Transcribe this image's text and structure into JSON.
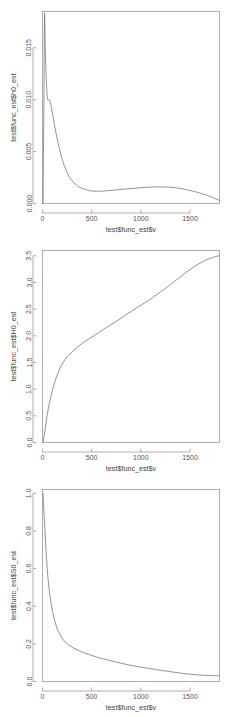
{
  "figure": {
    "background": "#ffffff",
    "line_color": "#6e6e6e",
    "axis_color": "#8c8c8c",
    "text_color": "#555555",
    "layout": "3 stacked panels, 1 column"
  },
  "chart_data": [
    {
      "type": "line",
      "title": "",
      "xlabel": "test$func_est$v",
      "ylabel": "test$func_est$h0_est",
      "xlim": [
        0,
        1800
      ],
      "ylim": [
        0,
        0.0185
      ],
      "xticks": [
        0,
        500,
        1000,
        1500
      ],
      "xtick_labels": [
        "0",
        "500",
        "1000",
        "1500"
      ],
      "yticks": [
        0.0,
        0.005,
        0.01,
        0.015
      ],
      "ytick_labels": [
        "0.000",
        "0.005",
        "0.010",
        "0.015"
      ],
      "grid": false,
      "legend": "none",
      "series": [
        {
          "name": "h0_est",
          "x": [
            5,
            14,
            20,
            28,
            38,
            50,
            62,
            75,
            90,
            110,
            135,
            160,
            190,
            220,
            255,
            290,
            330,
            370,
            415,
            460,
            505,
            560,
            620,
            690,
            760,
            830,
            900,
            970,
            1040,
            1100,
            1160,
            1220,
            1280,
            1340,
            1400,
            1470,
            1540,
            1610,
            1670,
            1730,
            1775,
            1800
          ],
          "y": [
            0.0,
            0.0096,
            0.0182,
            0.015,
            0.012,
            0.0102,
            0.01,
            0.0099,
            0.0093,
            0.0082,
            0.0069,
            0.0058,
            0.0046,
            0.0037,
            0.0029,
            0.0023,
            0.0019,
            0.0016,
            0.00142,
            0.00128,
            0.0012,
            0.00118,
            0.0012,
            0.00126,
            0.00132,
            0.00138,
            0.00144,
            0.0015,
            0.00155,
            0.00158,
            0.0016,
            0.0016,
            0.00158,
            0.00153,
            0.00145,
            0.00132,
            0.00117,
            0.00098,
            0.0008,
            0.00057,
            0.0004,
            0.0003
          ]
        }
      ]
    },
    {
      "type": "line",
      "title": "",
      "xlabel": "test$func_est$v",
      "ylabel": "test$func_est$H0_est",
      "xlim": [
        0,
        1800
      ],
      "ylim": [
        0,
        3.6
      ],
      "xticks": [
        0,
        500,
        1000,
        1500
      ],
      "xtick_labels": [
        "0",
        "500",
        "1000",
        "1500"
      ],
      "yticks": [
        0.0,
        0.5,
        1.0,
        1.5,
        2.0,
        2.5,
        3.0,
        3.5
      ],
      "ytick_labels": [
        "0.0",
        "0.5",
        "1.0",
        "1.5",
        "2.0",
        "2.5",
        "3.0",
        "3.5"
      ],
      "grid": false,
      "legend": "none",
      "series": [
        {
          "name": "H0_est",
          "x": [
            5,
            20,
            40,
            60,
            85,
            110,
            140,
            170,
            200,
            230,
            260,
            290,
            330,
            370,
            420,
            470,
            520,
            570,
            620,
            680,
            740,
            800,
            860,
            920,
            980,
            1040,
            1100,
            1160,
            1220,
            1280,
            1340,
            1400,
            1460,
            1520,
            1580,
            1640,
            1700,
            1750,
            1790,
            1800
          ],
          "y": [
            0.0,
            0.16,
            0.42,
            0.64,
            0.86,
            1.04,
            1.22,
            1.36,
            1.47,
            1.56,
            1.63,
            1.68,
            1.75,
            1.81,
            1.88,
            1.94,
            2.0,
            2.06,
            2.12,
            2.19,
            2.26,
            2.33,
            2.41,
            2.48,
            2.55,
            2.62,
            2.69,
            2.77,
            2.85,
            2.93,
            3.02,
            3.1,
            3.19,
            3.27,
            3.34,
            3.4,
            3.45,
            3.48,
            3.5,
            3.5
          ]
        }
      ]
    },
    {
      "type": "line",
      "title": "",
      "xlabel": "test$func_est$v",
      "ylabel": "test$func_est$S0_est",
      "xlim": [
        0,
        1800
      ],
      "ylim": [
        0,
        1.02
      ],
      "xticks": [
        0,
        500,
        1000,
        1500
      ],
      "xtick_labels": [
        "0",
        "500",
        "1000",
        "1500"
      ],
      "yticks": [
        0.0,
        0.2,
        0.4,
        0.6,
        0.8,
        1.0
      ],
      "ytick_labels": [
        "0.0",
        "0.2",
        "0.4",
        "0.6",
        "0.8",
        "1.0"
      ],
      "grid": false,
      "legend": "none",
      "series": [
        {
          "name": "S0_est",
          "x": [
            5,
            20,
            40,
            60,
            85,
            110,
            140,
            170,
            200,
            230,
            260,
            290,
            330,
            370,
            420,
            470,
            520,
            570,
            620,
            680,
            740,
            800,
            860,
            920,
            980,
            1040,
            1100,
            1160,
            1220,
            1280,
            1340,
            1400,
            1460,
            1520,
            1580,
            1640,
            1700,
            1750,
            1790,
            1800
          ],
          "y": [
            1.0,
            0.852,
            0.657,
            0.527,
            0.423,
            0.353,
            0.295,
            0.257,
            0.23,
            0.21,
            0.196,
            0.186,
            0.174,
            0.164,
            0.153,
            0.144,
            0.135,
            0.127,
            0.12,
            0.112,
            0.104,
            0.097,
            0.09,
            0.084,
            0.078,
            0.073,
            0.068,
            0.063,
            0.058,
            0.054,
            0.049,
            0.045,
            0.041,
            0.038,
            0.035,
            0.033,
            0.032,
            0.031,
            0.03,
            0.03
          ]
        }
      ]
    }
  ]
}
